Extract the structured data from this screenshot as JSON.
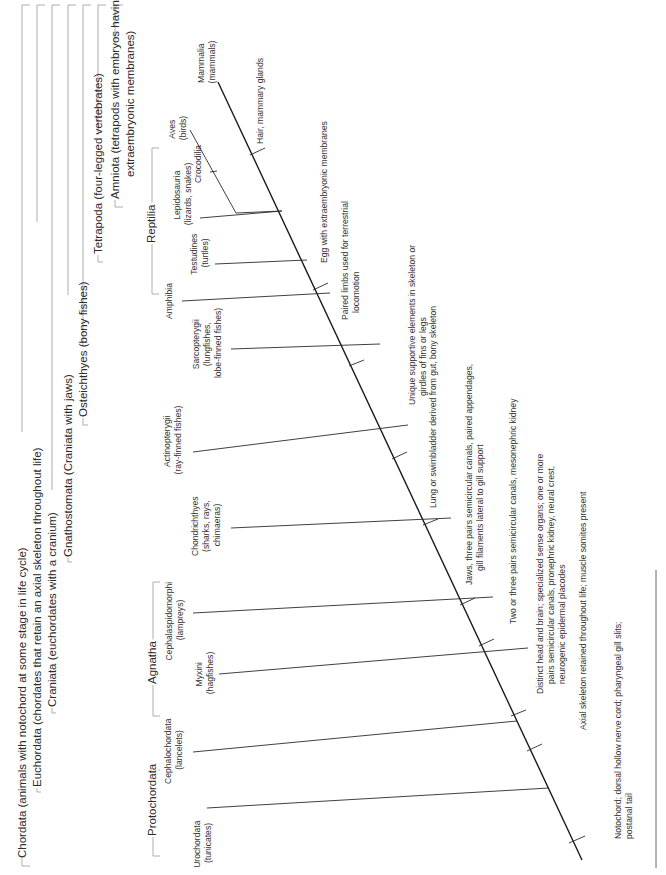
{
  "diagram": {
    "type": "cladogram",
    "orientation": "rotated-90-ccw",
    "colors": {
      "line": "#1a1a1a",
      "bracket": "#9a9a9a",
      "text": "#2b2b2b",
      "background": "#ffffff"
    },
    "nested_groups": [
      {
        "id": "chordata",
        "label": "Chordata (animals with notochord at some stage in life cycle)"
      },
      {
        "id": "euchordata",
        "label": "Euchordata (chordates that retain an axial skeleton throughout life)"
      },
      {
        "id": "craniata",
        "label": "Craniata (euchordates with a cranium)"
      },
      {
        "id": "gnathostomata",
        "label": "Gnathostomata (Craniata with jaws)"
      },
      {
        "id": "osteichthyes",
        "label": "Osteichthyes (bony fishes)"
      },
      {
        "id": "tetrapoda",
        "label": "Tetrapoda (four-legged vertebrates)"
      },
      {
        "id": "amniota",
        "label_line1": "Amniota (tetrapods with embryos having",
        "label_line2": "extraembryonic membranes)"
      }
    ],
    "paraphyletic_groups": [
      {
        "id": "protochordata",
        "label": "Protochordata"
      },
      {
        "id": "agnatha",
        "label": "Agnatha"
      },
      {
        "id": "reptilia",
        "label": "Reptilia"
      }
    ],
    "taxa": [
      {
        "id": "urochordata",
        "lines": [
          "Urochordata",
          "(tunicates)"
        ]
      },
      {
        "id": "cephalochordata",
        "lines": [
          "Cephalochordata",
          "(lancelets)"
        ]
      },
      {
        "id": "myxini",
        "lines": [
          "Myxini",
          "(hagfishes)"
        ]
      },
      {
        "id": "cephalaspidomorphi",
        "lines": [
          "Cephalaspidomorphi",
          "(lampreys)"
        ]
      },
      {
        "id": "chondrichthyes",
        "lines": [
          "Chondrichthyes",
          "(sharks, rays,",
          "chimaeras)"
        ]
      },
      {
        "id": "actinopterygii",
        "lines": [
          "Actinopterygii",
          "(ray-finned fishes)"
        ]
      },
      {
        "id": "sarcopterygii",
        "lines": [
          "Sarcopterygii",
          "(lungfishes,",
          "lobe-finned fishes)"
        ]
      },
      {
        "id": "amphibia",
        "lines": [
          "Amphibia"
        ]
      },
      {
        "id": "testudines",
        "lines": [
          "Testudines",
          "(turtles)"
        ]
      },
      {
        "id": "lepidosauria",
        "lines": [
          "Lepidosauria",
          "(lizards, snakes)"
        ]
      },
      {
        "id": "crocodilia",
        "lines": [
          "Crocodilia"
        ]
      },
      {
        "id": "aves",
        "lines": [
          "Aves",
          "(birds)"
        ]
      },
      {
        "id": "mammalia",
        "lines": [
          "Mammalia",
          "(mammals)"
        ]
      }
    ],
    "traits": [
      {
        "id": "t1",
        "lines": [
          "Notochord; dorsal hollow nerve cord; pharyngeal gill slits;",
          "postanal tail"
        ]
      },
      {
        "id": "t2",
        "lines": [
          "Axial skeleton retained throughout life; muscle somites present"
        ]
      },
      {
        "id": "t3",
        "lines": [
          "Distinct head and brain; specialized sense organs; one or more",
          "pairs semicircular canals, pronephric kidney, neural crest,",
          "neurogenic epidermal placodes"
        ]
      },
      {
        "id": "t4",
        "lines": [
          "Two or three pairs semicircular canals, mesonephric kidney"
        ]
      },
      {
        "id": "t5",
        "lines": [
          "Jaws, three pairs semicircular canals, paired appendages,",
          "gill filaments lateral to gill support"
        ]
      },
      {
        "id": "t6",
        "lines": [
          "Lung or swimbladder derived from gut, bony skeleton"
        ]
      },
      {
        "id": "t7",
        "lines": [
          "Unique supportive elements in skeleton or",
          "girdles of fins or legs"
        ]
      },
      {
        "id": "t8",
        "lines": [
          "Paired limbs used for terrestrial",
          "locomotion"
        ]
      },
      {
        "id": "t9",
        "lines": [
          "Egg with extraembryonic membranes"
        ]
      },
      {
        "id": "t10",
        "lines": [
          "Hair, mammary glands"
        ]
      }
    ]
  }
}
